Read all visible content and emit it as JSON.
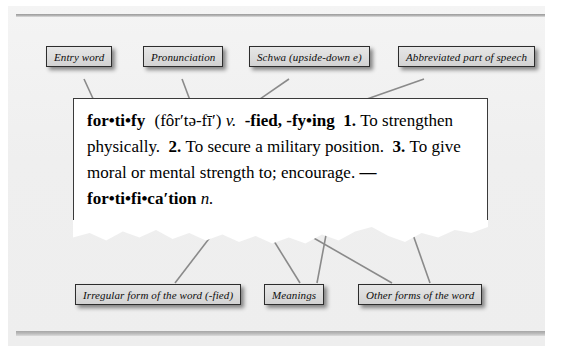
{
  "figure": {
    "top_labels": [
      {
        "id": "entry-word",
        "text": "Entry word"
      },
      {
        "id": "pronunciation",
        "text": "Pronunciation"
      },
      {
        "id": "schwa",
        "text": "Schwa (upside-down e)"
      },
      {
        "id": "part-of-speech",
        "text": "Abbreviated part of speech"
      }
    ],
    "bottom_labels": [
      {
        "id": "irregular-form",
        "text": "Irregular form of the word (-fied)"
      },
      {
        "id": "meanings",
        "text": "Meanings"
      },
      {
        "id": "other-forms",
        "text": "Other forms of the word"
      }
    ]
  },
  "entry": {
    "headword": "for•ti•fy",
    "pronunciation": "(fôr′tə-fī′)",
    "part_of_speech": "v.",
    "inflections": "-fied, -fy•ing",
    "sense1_num": "1.",
    "sense1_text": "To strengthen physically.",
    "sense2_num": "2.",
    "sense2_text": "To secure a military position.",
    "sense3_num": "3.",
    "sense3_text": "To give moral or mental strength to; encourage.",
    "derived_dash": "—",
    "derived_word": "for•ti•fi•ca′tion",
    "derived_pos": "n."
  },
  "colors": {
    "label_fill": "#dcdcdc",
    "label_border": "#2d2d2d",
    "leader_line": "#8a8a8a",
    "paper": "#ffffff",
    "panel": "#efefef",
    "text": "#000000"
  }
}
